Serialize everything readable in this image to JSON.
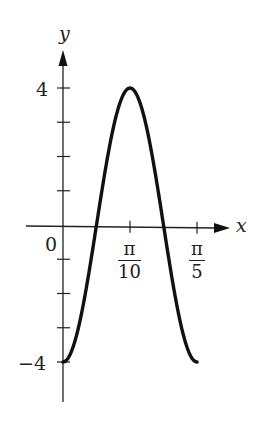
{
  "chart_data": {
    "type": "line",
    "title": "",
    "function": "y = -4 cos(10x)",
    "xlabel": "x",
    "ylabel": "y",
    "x_ticks": [
      {
        "value": 0,
        "label": "0"
      },
      {
        "value": 0.3141593,
        "label_num": "π",
        "label_den": "10"
      },
      {
        "value": 0.6283185,
        "label_num": "π",
        "label_den": "5"
      }
    ],
    "y_ticks": [
      -4,
      -3,
      -2,
      -1,
      0,
      1,
      2,
      3,
      4
    ],
    "y_tick_labels": [
      {
        "value": 4,
        "label": "4"
      },
      {
        "value": -4,
        "label": "−4"
      }
    ],
    "xlim": [
      0,
      0.6283185
    ],
    "ylim": [
      -4,
      4
    ],
    "grid": false,
    "legend": null,
    "series": [
      {
        "name": "curve",
        "x": [
          0,
          0.0157,
          0.0314,
          0.0471,
          0.0628,
          0.0785,
          0.0942,
          0.11,
          0.1257,
          0.1414,
          0.1571,
          0.1728,
          0.1885,
          0.2042,
          0.2199,
          0.2356,
          0.2513,
          0.267,
          0.2827,
          0.2985,
          0.3142,
          0.3299,
          0.3456,
          0.3613,
          0.377,
          0.3927,
          0.4084,
          0.4241,
          0.4398,
          0.4555,
          0.4712,
          0.4869,
          0.5027,
          0.5184,
          0.5341,
          0.5498,
          0.5655,
          0.5812,
          0.5969,
          0.6126,
          0.6283
        ],
        "y": [
          -4.0,
          -3.95,
          -3.8,
          -3.56,
          -3.24,
          -2.83,
          -2.35,
          -1.82,
          -1.24,
          -0.63,
          0.0,
          0.63,
          1.24,
          1.82,
          2.35,
          2.83,
          3.24,
          3.56,
          3.8,
          3.95,
          4.0,
          3.95,
          3.8,
          3.56,
          3.24,
          2.83,
          2.35,
          1.82,
          1.24,
          0.63,
          0.0,
          -0.63,
          -1.24,
          -1.82,
          -2.35,
          -2.83,
          -3.24,
          -3.56,
          -3.8,
          -3.95,
          -4.0
        ]
      }
    ]
  },
  "labels": {
    "y_axis": "y",
    "x_axis": "x",
    "origin": "0",
    "y_top": "4",
    "y_bottom": "−4",
    "pi_over_10_num": "π",
    "pi_over_10_den": "10",
    "pi_over_5_num": "π",
    "pi_over_5_den": "5"
  }
}
